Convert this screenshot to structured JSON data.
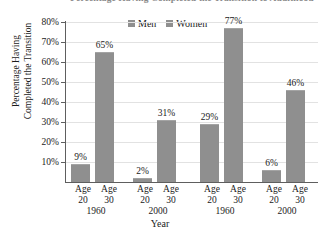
{
  "chart_data": {
    "type": "bar",
    "title": "Percentage Having Completed the Transition to Adulthood",
    "xlabel": "Year",
    "ylabel_line1": "Percentage Having",
    "ylabel_line2": "Completed the Transition",
    "ylim": [
      0,
      80
    ],
    "ytick_labels": [
      "80%",
      "70%",
      "60%",
      "50%",
      "40%",
      "30%",
      "20%",
      "10%"
    ],
    "ytick_values": [
      80,
      70,
      60,
      50,
      40,
      30,
      20,
      10
    ],
    "grid": true,
    "legend_position": "top-center",
    "legend": [
      "Men",
      "Women"
    ],
    "bar_color": "#8f8f8f",
    "groups": [
      {
        "series": "Men",
        "year": "1960",
        "age_labels": [
          "Age",
          "Age"
        ],
        "ages": [
          "20",
          "30"
        ]
      },
      {
        "series": "Men",
        "year": "2000",
        "age_labels": [
          "Age",
          "Age"
        ],
        "ages": [
          "20",
          "30"
        ]
      },
      {
        "series": "Women",
        "year": "1960",
        "age_labels": [
          "Age",
          "Age"
        ],
        "ages": [
          "20",
          "30"
        ]
      },
      {
        "series": "Women",
        "year": "2000",
        "age_labels": [
          "Age",
          "Age"
        ],
        "ages": [
          "20",
          "30"
        ]
      }
    ],
    "categories": [
      "Men Age 20 1960",
      "Men Age 30 1960",
      "Men Age 20 2000",
      "Men Age 30 2000",
      "Women Age 20 1960",
      "Women Age 30 1960",
      "Women Age 20 2000",
      "Women Age 30 2000"
    ],
    "values": [
      9,
      65,
      2,
      31,
      29,
      77,
      6,
      46
    ],
    "value_labels": [
      "9%",
      "65%",
      "2%",
      "31%",
      "29%",
      "77%",
      "6%",
      "46%"
    ]
  },
  "axis": {
    "ticks": [
      {
        "label": "80%"
      },
      {
        "label": "70%"
      },
      {
        "label": "60%"
      },
      {
        "label": "50%"
      },
      {
        "label": "40%"
      },
      {
        "label": "30%"
      },
      {
        "label": "20%"
      },
      {
        "label": "10%"
      }
    ]
  },
  "xgroups": [
    {
      "age_a": "Age",
      "num_a": "20",
      "age_b": "Age",
      "num_b": "30",
      "year": "1960"
    },
    {
      "age_a": "Age",
      "num_a": "20",
      "age_b": "Age",
      "num_b": "30",
      "year": "2000"
    },
    {
      "age_a": "Age",
      "num_a": "20",
      "age_b": "Age",
      "num_b": "30",
      "year": "1960"
    },
    {
      "age_a": "Age",
      "num_a": "20",
      "age_b": "Age",
      "num_b": "30",
      "year": "2000"
    }
  ],
  "legend": {
    "men": "Men",
    "women": "Women"
  },
  "labels": {
    "xaxis": "Year",
    "yaxis_line1": "Percentage Having",
    "yaxis_line2": "Completed the Transition",
    "title": "Percentage Having Completed the Transition to Adulthood"
  }
}
